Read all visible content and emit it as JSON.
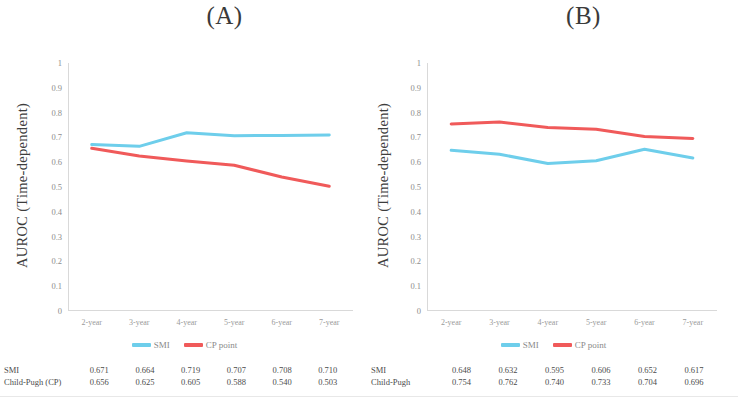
{
  "figure": {
    "panels": [
      {
        "title": "(A)",
        "ylabel": "AUROC (Time-dependent)",
        "yticks": [
          "1",
          "0.9",
          "0.8",
          "0.7",
          "0.6",
          "0.5",
          "0.4",
          "0.3",
          "0.2",
          "0.1",
          "0"
        ],
        "xticks": [
          "2-year",
          "3-year",
          "4-year",
          "5-year",
          "6-year",
          "7-year"
        ],
        "legend": [
          {
            "label": "SMI",
            "color": "#6ECEEB"
          },
          {
            "label": "CP point",
            "color": "#F05A5A"
          }
        ],
        "table": {
          "rows": [
            {
              "label": "SMI",
              "values": [
                "0.671",
                "0.664",
                "0.719",
                "0.707",
                "0.708",
                "0.710"
              ]
            },
            {
              "label": "Child-Pugh (CP)",
              "values": [
                "0.656",
                "0.625",
                "0.605",
                "0.588",
                "0.540",
                "0.503"
              ]
            }
          ]
        }
      },
      {
        "title": "(B)",
        "ylabel": "AUROC (Time-dependent)",
        "yticks": [
          "1",
          "0.9",
          "0.8",
          "0.7",
          "0.6",
          "0.5",
          "0.4",
          "0.3",
          "0.2",
          "0.1",
          "0"
        ],
        "xticks": [
          "2-year",
          "3-year",
          "4-year",
          "5-year",
          "6-year",
          "7-year"
        ],
        "legend": [
          {
            "label": "SMI",
            "color": "#6ECEEB"
          },
          {
            "label": "CP point",
            "color": "#F05A5A"
          }
        ],
        "table": {
          "rows": [
            {
              "label": "SMI",
              "values": [
                "0.648",
                "0.632",
                "0.595",
                "0.606",
                "0.652",
                "0.617"
              ]
            },
            {
              "label": "Child-Pugh",
              "values": [
                "0.754",
                "0.762",
                "0.740",
                "0.733",
                "0.704",
                "0.696"
              ]
            }
          ]
        }
      }
    ]
  },
  "chart_data": [
    {
      "type": "line",
      "title": "(A)",
      "xlabel": "",
      "ylabel": "AUROC (Time-dependent)",
      "categories": [
        "2-year",
        "3-year",
        "4-year",
        "5-year",
        "6-year",
        "7-year"
      ],
      "ylim": [
        0,
        1
      ],
      "yticks": [
        0,
        0.1,
        0.2,
        0.3,
        0.4,
        0.5,
        0.6,
        0.7,
        0.8,
        0.9,
        1
      ],
      "grid": false,
      "legend_position": "bottom",
      "series": [
        {
          "name": "SMI",
          "color": "#6ECEEB",
          "values": [
            0.671,
            0.664,
            0.719,
            0.707,
            0.708,
            0.71
          ]
        },
        {
          "name": "CP point",
          "color": "#F05A5A",
          "values": [
            0.656,
            0.625,
            0.605,
            0.588,
            0.54,
            0.503
          ]
        }
      ]
    },
    {
      "type": "line",
      "title": "(B)",
      "xlabel": "",
      "ylabel": "AUROC (Time-dependent)",
      "categories": [
        "2-year",
        "3-year",
        "4-year",
        "5-year",
        "6-year",
        "7-year"
      ],
      "ylim": [
        0,
        1
      ],
      "yticks": [
        0,
        0.1,
        0.2,
        0.3,
        0.4,
        0.5,
        0.6,
        0.7,
        0.8,
        0.9,
        1
      ],
      "grid": false,
      "legend_position": "bottom",
      "series": [
        {
          "name": "SMI",
          "color": "#6ECEEB",
          "values": [
            0.648,
            0.632,
            0.595,
            0.606,
            0.652,
            0.617
          ]
        },
        {
          "name": "CP point",
          "color": "#F05A5A",
          "values": [
            0.754,
            0.762,
            0.74,
            0.733,
            0.704,
            0.696
          ]
        }
      ]
    }
  ]
}
